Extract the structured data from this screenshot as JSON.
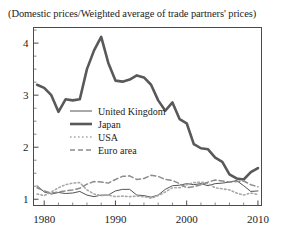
{
  "chart_data": {
    "type": "line",
    "title": "(Domestic prices/Weighted average of trade partners' prices)",
    "xlabel": "",
    "ylabel": "",
    "xlim": [
      1978.5,
      2010.5
    ],
    "ylim": [
      0.88,
      4.3
    ],
    "grid": false,
    "legend_position": "inside-center-left",
    "x_ticks": [
      1980,
      1990,
      2000,
      2010
    ],
    "x_tick_labels": [
      "1980",
      "1990",
      "2000",
      "2010"
    ],
    "y_ticks": [
      1,
      2,
      3,
      4
    ],
    "y_tick_labels": [
      "1",
      "2",
      "3",
      "4"
    ],
    "y_minor_tick_step": 0.25,
    "x_minor_tick_step": 2,
    "x": [
      1979,
      1980,
      1981,
      1982,
      1983,
      1984,
      1985,
      1986,
      1987,
      1988,
      1989,
      1990,
      1991,
      1992,
      1993,
      1994,
      1995,
      1996,
      1997,
      1998,
      1999,
      2000,
      2001,
      2002,
      2003,
      2004,
      2005,
      2006,
      2007,
      2008,
      2009,
      2010
    ],
    "series": [
      {
        "name": "United Kingdom",
        "style": "solid-thin",
        "color": "#404040",
        "values": [
          1.26,
          1.14,
          1.1,
          1.13,
          1.11,
          1.12,
          1.15,
          1.08,
          1.05,
          1.08,
          1.08,
          1.16,
          1.19,
          1.19,
          1.08,
          1.07,
          1.04,
          1.08,
          1.19,
          1.26,
          1.27,
          1.3,
          1.28,
          1.3,
          1.26,
          1.3,
          1.31,
          1.33,
          1.36,
          1.26,
          1.15,
          1.16
        ]
      },
      {
        "name": "Japan",
        "style": "solid-thick",
        "color": "#595959",
        "values": [
          3.2,
          3.14,
          3.0,
          2.68,
          2.92,
          2.9,
          2.92,
          3.5,
          3.86,
          4.12,
          3.62,
          3.28,
          3.26,
          3.3,
          3.38,
          3.34,
          3.2,
          2.9,
          2.7,
          2.86,
          2.54,
          2.46,
          2.06,
          1.98,
          1.96,
          1.8,
          1.72,
          1.48,
          1.4,
          1.38,
          1.52,
          1.6
        ]
      },
      {
        "name": "USA",
        "style": "dotted",
        "color": "#a8a8a8",
        "values": [
          1.1,
          1.07,
          1.14,
          1.22,
          1.28,
          1.31,
          1.32,
          1.18,
          1.1,
          1.07,
          1.08,
          1.05,
          1.06,
          1.05,
          1.06,
          1.05,
          1.02,
          1.07,
          1.14,
          1.22,
          1.22,
          1.28,
          1.32,
          1.33,
          1.3,
          1.22,
          1.2,
          1.18,
          1.12,
          1.08,
          1.12,
          1.09
        ]
      },
      {
        "name": "Euro area",
        "style": "dashed",
        "color": "#8c8c8c",
        "values": [
          1.22,
          1.16,
          1.12,
          1.14,
          1.16,
          1.18,
          1.21,
          1.29,
          1.34,
          1.33,
          1.31,
          1.38,
          1.44,
          1.45,
          1.38,
          1.4,
          1.46,
          1.44,
          1.38,
          1.36,
          1.3,
          1.22,
          1.24,
          1.28,
          1.33,
          1.37,
          1.35,
          1.33,
          1.34,
          1.35,
          1.28,
          1.24
        ]
      }
    ]
  },
  "legend": {
    "items": [
      {
        "label": "United Kingdom",
        "style": "solid-thin"
      },
      {
        "label": "Japan",
        "style": "solid-thick"
      },
      {
        "label": "USA",
        "style": "dotted"
      },
      {
        "label": "Euro area",
        "style": "dashed"
      }
    ]
  }
}
